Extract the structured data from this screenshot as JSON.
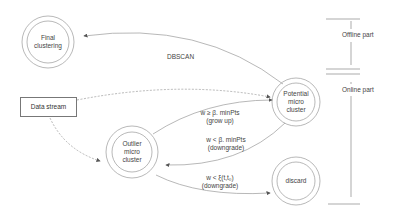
{
  "nodes": {
    "final_clustering": {
      "label": "Final\nclustering",
      "line1": "Final",
      "line2": "clustering"
    },
    "data_stream": {
      "label": "Data stream"
    },
    "potential_micro_cluster": {
      "line1": "Potential",
      "line2": "micro",
      "line3": "cluster"
    },
    "outlier_micro_cluster": {
      "line1": "Outlier",
      "line2": "micro",
      "line3": "cluster"
    },
    "discard": {
      "label": "discard"
    }
  },
  "edges": {
    "dbscan": {
      "label": "DBSCAN"
    },
    "grow_up": {
      "line1": "w ≥ β. minPts",
      "line2": "(grow up)"
    },
    "downgrade_potential": {
      "line1": "w < β. minPts",
      "line2": "(downgrade)"
    },
    "downgrade_outlier": {
      "line1": "w < ξ(t,t₀)",
      "line2": "(downgrade)"
    }
  },
  "sections": {
    "offline": {
      "label": "Offline part"
    },
    "online": {
      "label": "Online part"
    }
  },
  "colors": {
    "stroke": "#999999",
    "text": "#444444",
    "background": "#ffffff"
  }
}
